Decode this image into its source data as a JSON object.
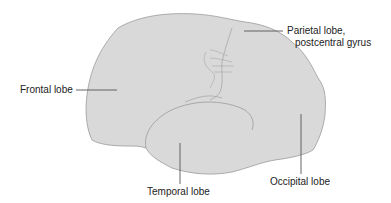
{
  "diagram": {
    "fill_color": "#d9d9d9",
    "outline_color": "#9a9a9a",
    "leader_color": "#555555",
    "labels": {
      "frontal": "Frontal lobe",
      "parietal_line1": "Parietal lobe,",
      "parietal_line2": "postcentral gyrus",
      "temporal": "Temporal lobe",
      "occipital": "Occipital lobe"
    }
  }
}
